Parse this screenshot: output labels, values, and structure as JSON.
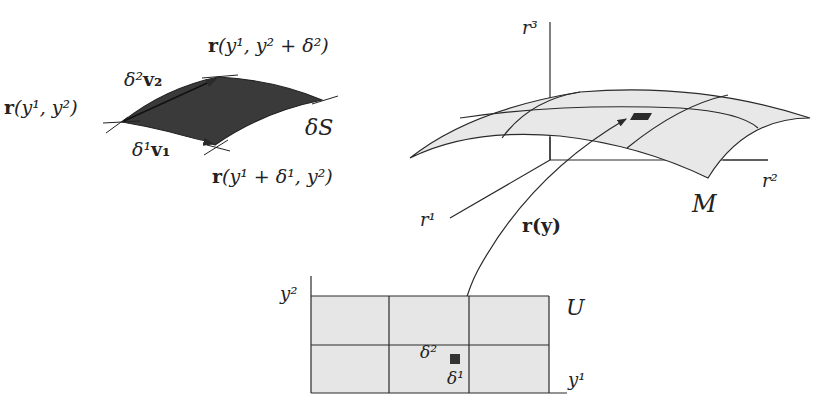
{
  "colors": {
    "line": "#2a2a2a",
    "surface_fill": "#e8e8e8",
    "patch_fill": "#3a3a3a",
    "domain_fill": "#e6e6e6",
    "background": "#ffffff"
  },
  "patch_labels": {
    "r_corner_base": "r",
    "r_corner_args": "(y¹, y²)",
    "r_corner_top_args": "(y¹, y² + δ²)",
    "r_corner_bottom_args": "(y¹ + δ¹, y²)",
    "v2_label_coef": "δ²",
    "v2_label_vec": "v₂",
    "v1_label_coef": "δ¹",
    "v1_label_vec": "v₁",
    "area_label": "δS"
  },
  "surface_labels": {
    "axis_r1": "r¹",
    "axis_r2": "r²",
    "axis_r3": "r³",
    "manifold": "M",
    "map_base": "r",
    "map_args": "(y)"
  },
  "domain_labels": {
    "axis_y1": "y¹",
    "axis_y2": "y²",
    "region": "U",
    "delta1": "δ¹",
    "delta2": "δ²"
  }
}
